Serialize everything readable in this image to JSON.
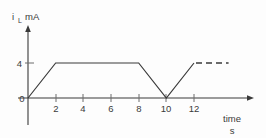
{
  "chart_data": {
    "type": "line",
    "title": "",
    "subtitle": "",
    "ylabel": "i",
    "ylabel_subscript": "L",
    "yunit": "mA",
    "xlabel": "time",
    "xunit": "s",
    "x": [
      0,
      2,
      8,
      10,
      12
    ],
    "values": [
      0,
      4,
      4,
      0,
      4
    ],
    "series": [
      {
        "name": "iL",
        "x": [
          0,
          2,
          8,
          10,
          12
        ],
        "values": [
          0,
          4,
          4,
          0,
          4
        ]
      }
    ],
    "dashed_continuation": {
      "from_x": 12,
      "to_x": 14.5,
      "y": 4
    },
    "xticks": [
      2,
      4,
      6,
      8,
      10,
      12
    ],
    "xtick_labels": [
      "2",
      "4",
      "6",
      "8",
      "10",
      "12"
    ],
    "yticks": [
      4
    ],
    "ytick_labels": [
      "4"
    ],
    "origin_label": "0",
    "xlim": [
      0,
      16.3
    ],
    "ylim": [
      0,
      7.2
    ],
    "grid": false,
    "legend": false,
    "colors": {
      "background": "#fdfdfd",
      "axis": "#3a3a3a",
      "trace": "#3a3a3a",
      "tick": "#6d6d6d"
    }
  },
  "labels": {
    "y_axis_current": "i",
    "y_axis_current_sub": "L",
    "y_axis_unit": "mA",
    "x_axis_name": "time",
    "x_axis_unit": "s",
    "origin": "0",
    "y_tick_4": "4",
    "x_tick_2": "2",
    "x_tick_4": "4",
    "x_tick_6": "6",
    "x_tick_8": "8",
    "x_tick_10": "10",
    "x_tick_12": "12"
  }
}
